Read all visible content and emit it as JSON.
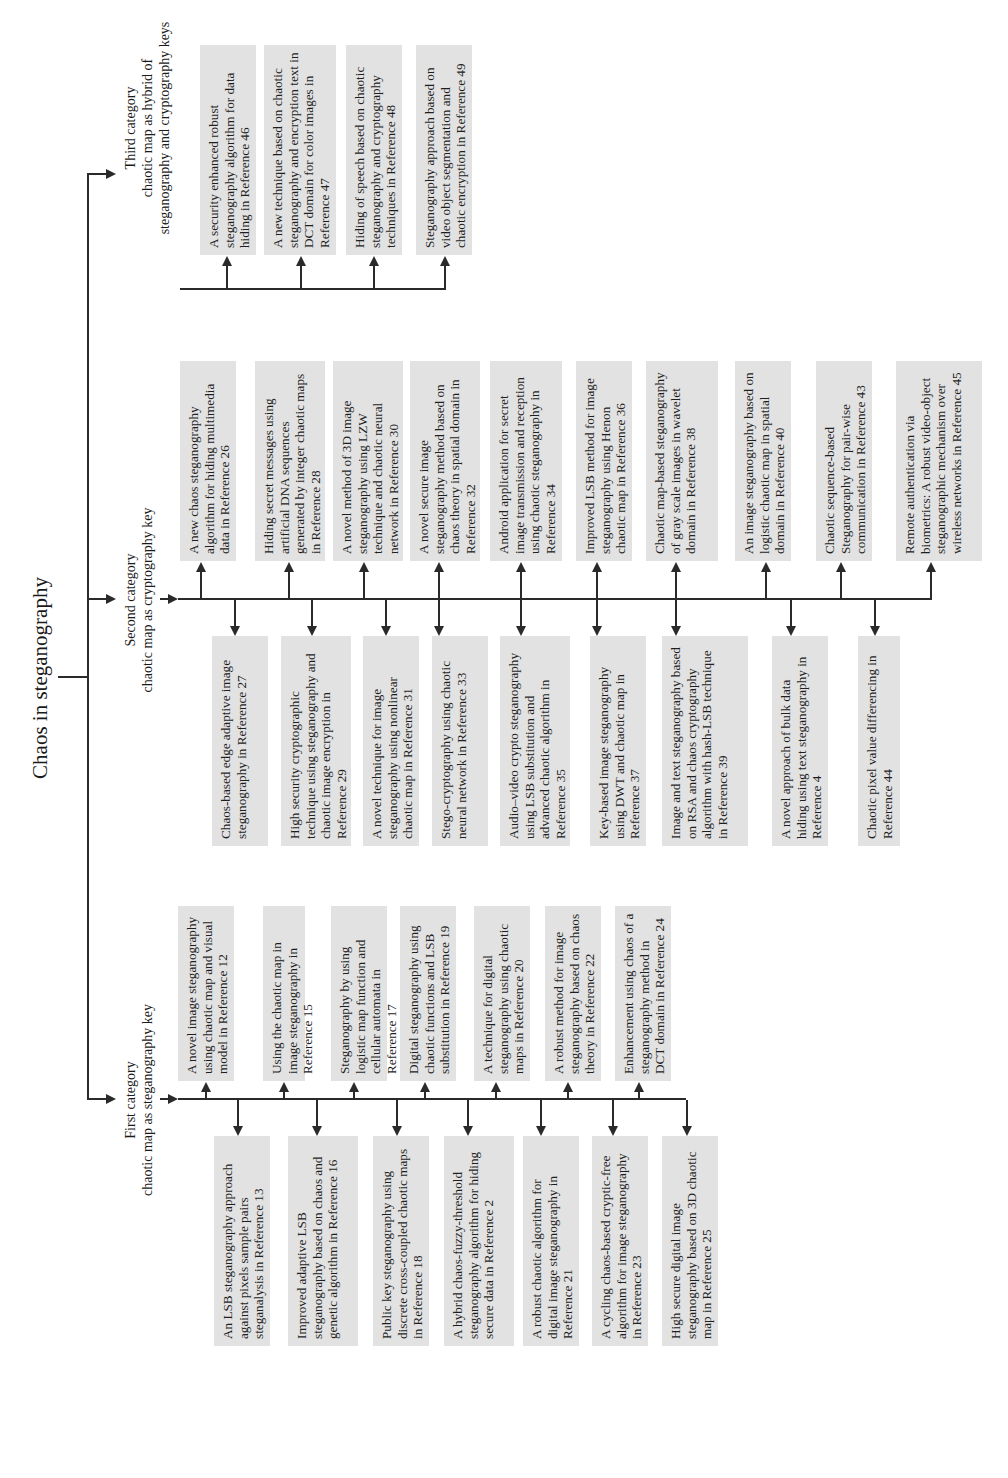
{
  "title": "Chaos in steganography",
  "categories": {
    "first": {
      "line1": "First category",
      "line2": "chaotic map as steganography key",
      "right": [
        "A novel image steganography using chaotic map and visual model in Reference 12",
        "Using the chaotic map in image steganography in Reference 15",
        "Steganography by using logistic map function and cellular automata in Reference 17",
        "Digital steganography using chaotic functions and LSB substitution in Reference 19",
        "A technique for digital steganography using chaotic maps in Reference 20",
        "A robust method for image steganography based on chaos theory in Reference 22",
        "Enhancement using chaos of a steganography method in DCT domain in Reference 24"
      ],
      "left": [
        "An LSB steganography approach against pixels sample pairs steganalysis in Reference 13",
        "Improved adaptive LSB steganography based on chaos and genetic algorithm in Reference 16",
        "Public key steganography using discrete cross-coupled chaotic maps in Reference 18",
        "A hybrid chaos-fuzzy-threshold steganography algorithm for hiding secure data in Reference 2",
        "A robust chaotic algorithm for digital image steganography in Reference 21",
        "A cycling chaos-based cryptic-free algorithm for image steganography in Reference 23",
        "High secure digital image steganography based on 3D chaotic map in Reference 25"
      ]
    },
    "second": {
      "line1": "Second category",
      "line2": "chaotic map as cryptography key",
      "right": [
        "A new chaos steganography algorithm for hiding multimedia data in Reference 26",
        "Hiding secret messages using artificial DNA sequences generated by integer chaotic maps in Reference 28",
        "A novel method of 3D image steganography using LZW technique and chaotic neural network in Reference 30",
        "A novel secure image steganography method based on chaos theory in spatial domain in Reference 32",
        "Android application for secret image transmission and reception using chaotic steganography in Reference 34",
        "Improved LSB method for image steganography using Henon chaotic map in Reference 36",
        "Chaotic map-based steganography of gray scale images in wavelet domain in Reference 38",
        "An image steganography based on logistic chaotic map in spatial domain in Reference 40",
        "Chaotic sequence-based Steganography for pair-wise communication in Reference 43",
        "Remote authentication via biometrics: A robust video-object steganographic mechanism over wireless networks in Reference 45"
      ],
      "left": [
        "Chaos-based edge adaptive image steganography in Reference 27",
        "High security cryptographic technique using steganography and chaotic image encryption in Reference 29",
        "A novel technique for image steganography using nonlinear chaotic map in Reference 31",
        "Stego-cryptography using chaotic neural network in Reference 33",
        "Audio–video crypto steganography using LSB substitution and advanced chaotic algorithm in Reference 35",
        "Key-based image steganography using DWT and chaotic map in Reference 37",
        "Image and text steganography based on RSA and chaos cryptography algorithm with hash-LSB technique in Reference 39",
        "A novel approach of bulk data hiding using text steganography in Reference 4",
        "Chaotic pixel value differencing in Reference 44"
      ]
    },
    "third": {
      "line1": "Third category",
      "line2": "chaotic map as hybrid of",
      "line3": "steganography and cryptography keys",
      "right": [
        "A security enhanced robust steganography algorithm for data hiding in Reference 46",
        "A new technique based on chaotic steganography and encryption text in DCT domain for color images in Reference 47",
        "Hiding of speech based on chaotic steganography and cryptography techniques in Reference 48",
        "Steganography approach based on video object segmentation and chaotic encryption in Reference 49"
      ]
    }
  }
}
